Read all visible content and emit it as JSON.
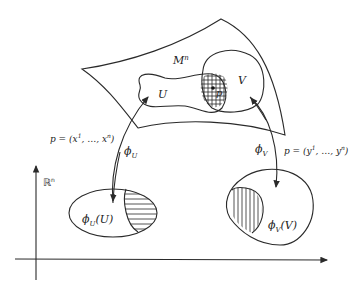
{
  "diagram": {
    "manifold_label": "M",
    "manifold_sup": "n",
    "region_u_label": "U",
    "region_v_label": "V",
    "point_label": "p",
    "coords_x": {
      "prefix": "p = (x",
      "sup1": "1",
      "mid": ", …, x",
      "supn": "n",
      "suffix": ")"
    },
    "coords_y": {
      "prefix": "p = (y",
      "sup1": "1",
      "mid": ", …, y",
      "supn": "n",
      "suffix": ")"
    },
    "phi_u": {
      "base": "ϕ",
      "sub": "U"
    },
    "phi_v": {
      "base": "ϕ",
      "sub": "V"
    },
    "image_u": {
      "base": "ϕ",
      "sub": "U",
      "arg": "(U)"
    },
    "image_v": {
      "base": "ϕ",
      "sub": "V",
      "arg": "(V)"
    },
    "space_label": "ℝ",
    "space_sup": "n",
    "colors": {
      "ink": "#2a2a2a",
      "background": "#ffffff"
    }
  }
}
